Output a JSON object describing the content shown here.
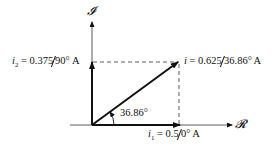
{
  "diagram": {
    "type": "phasor-diagram",
    "axes": {
      "imaginary_label": "𝓘",
      "real_label": "𝓡"
    },
    "phasors": [
      {
        "name": "i1",
        "symbol": "i",
        "sub": "1",
        "eq": " = 0.5",
        "angle": "0°",
        "unit": " A",
        "magnitude": 0.5,
        "angle_deg": 0
      },
      {
        "name": "i2",
        "symbol": "i",
        "sub": "2",
        "eq": " = 0.375",
        "angle": "90°",
        "unit": " A",
        "magnitude": 0.375,
        "angle_deg": 90
      },
      {
        "name": "i",
        "symbol": "i",
        "sub": "",
        "eq": " = 0.625",
        "angle": "36.86°",
        "unit": " A",
        "magnitude": 0.625,
        "angle_deg": 36.86
      }
    ],
    "angle_annotation": "36.86°",
    "colors": {
      "line": "#111111",
      "background": "#ffffff"
    }
  }
}
